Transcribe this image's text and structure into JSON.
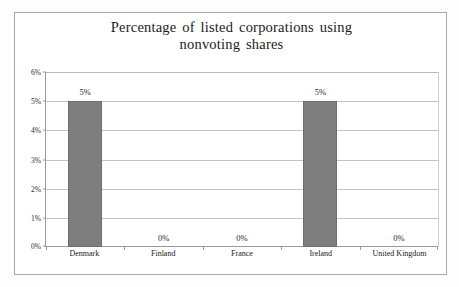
{
  "chart_data": {
    "type": "bar",
    "title": "Percentage of listed corporations using nonvoting shares",
    "title_line1": "Percentage  of listed  corporations  using",
    "title_line2": "nonvoting  shares",
    "categories": [
      "Denmark",
      "Finland",
      "France",
      "Ireland",
      "United Kingdom"
    ],
    "values": [
      5,
      0,
      0,
      5,
      0
    ],
    "value_labels": [
      "5%",
      "0%",
      "0%",
      "5%",
      "0%"
    ],
    "xlabel": "",
    "ylabel": "",
    "ylim": [
      0,
      6
    ],
    "yticks": [
      0,
      1,
      2,
      3,
      4,
      5,
      6
    ],
    "ytick_labels": [
      "0%",
      "1%",
      "2%",
      "3%",
      "4%",
      "5%",
      "6%"
    ],
    "grid": true,
    "legend": false,
    "series": [
      {
        "name": "Percentage of listed corporations using nonvoting shares",
        "values": [
          5,
          0,
          0,
          5,
          0
        ]
      }
    ],
    "colors": {
      "bar_fill": "#7e7e7e",
      "bar_border": "#6e6e6e",
      "gridline": "#c3c3c3",
      "axis": "#9a9a9a",
      "text": "#1f1f1f",
      "frame": "#a8a8a8",
      "plot_background": "#ffffff"
    }
  }
}
